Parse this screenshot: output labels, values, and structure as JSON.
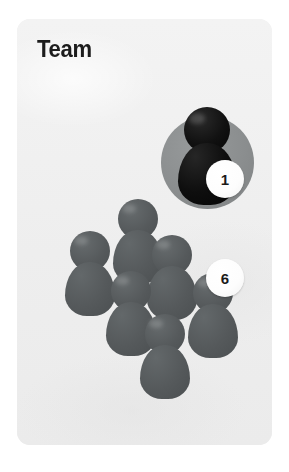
{
  "card": {
    "title": "Team",
    "background_color": "#efefef"
  },
  "figures": {
    "leader": {
      "name": "leader-figure",
      "color": "#0d0d0d",
      "highlight_disc_color": "#8a8d8e",
      "badge": "1",
      "count": 1
    },
    "members": {
      "name": "member-figure",
      "color": "#55595b",
      "badge": "6",
      "count": 6,
      "positions": [
        {
          "x": 95,
          "y": 180,
          "scale": 1.0
        },
        {
          "x": 47,
          "y": 212,
          "scale": 1.0
        },
        {
          "x": 129,
          "y": 216,
          "scale": 1.0
        },
        {
          "x": 88,
          "y": 252,
          "scale": 1.0
        },
        {
          "x": 170,
          "y": 254,
          "scale": 1.0
        },
        {
          "x": 122,
          "y": 295,
          "scale": 1.0
        }
      ]
    }
  },
  "badges": {
    "leader_label": "1",
    "members_label": "6"
  }
}
